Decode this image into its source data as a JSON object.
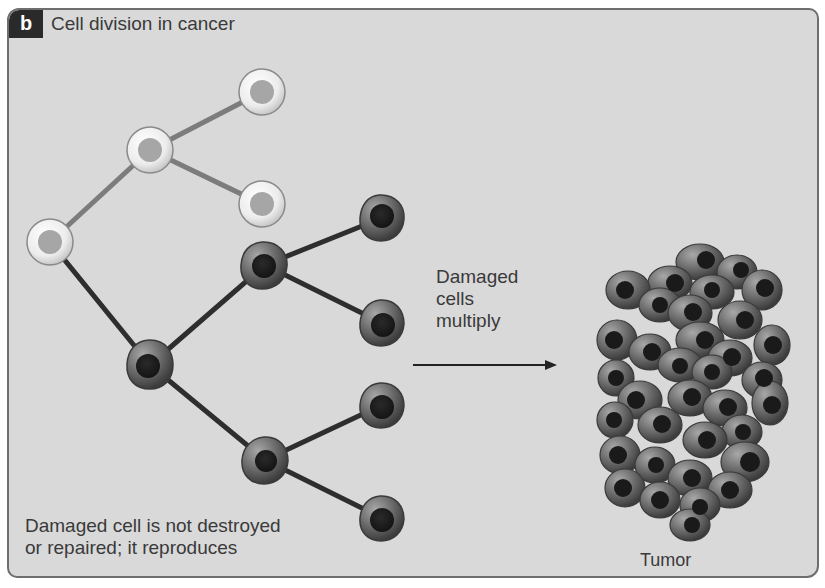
{
  "figure": {
    "panel_letter": "b",
    "title": "Cell division in cancer"
  },
  "labels": {
    "multiply_line1": "Damaged",
    "multiply_line2": "cells",
    "multiply_line3": "multiply",
    "damaged_line1": "Damaged cell is not destroyed",
    "damaged_line2": "or repaired; it reproduces",
    "tumor": "Tumor"
  },
  "colors": {
    "background": "#d9d9d9",
    "healthy_cell_membrane": "#f2f2f2",
    "healthy_cell_nucleus": "#a8a8a8",
    "healthy_line": "#7a7a7a",
    "damaged_cell_body": "#6a6a6a",
    "damaged_cell_nucleus": "#1e1e1e",
    "damaged_line": "#2e2e2e"
  },
  "diagram": {
    "healthy_cells": [
      {
        "id": "h1",
        "x": 50,
        "y": 242
      },
      {
        "id": "h2",
        "x": 150,
        "y": 150
      },
      {
        "id": "h3",
        "x": 262,
        "y": 92
      },
      {
        "id": "h4",
        "x": 262,
        "y": 204
      }
    ],
    "damaged_cells": [
      {
        "id": "d1",
        "x": 150,
        "y": 365
      },
      {
        "id": "d2",
        "x": 265,
        "y": 265
      },
      {
        "id": "d3",
        "x": 265,
        "y": 460
      },
      {
        "id": "d4",
        "x": 382,
        "y": 218
      },
      {
        "id": "d5",
        "x": 382,
        "y": 323
      },
      {
        "id": "d6",
        "x": 382,
        "y": 405
      },
      {
        "id": "d7",
        "x": 382,
        "y": 518
      }
    ]
  }
}
